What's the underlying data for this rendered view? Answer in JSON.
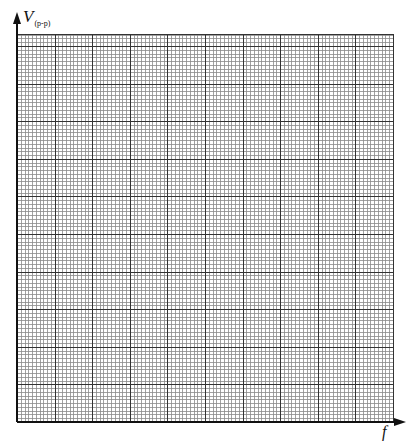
{
  "chart_data": {
    "type": "line",
    "title": "",
    "xlabel": "f",
    "ylabel": "V",
    "ylabel_subscript": "(p-p)",
    "series": [],
    "x": [],
    "values": [],
    "grid": true,
    "grid_style": {
      "major_divisions_x": 10,
      "minor_per_major": 10,
      "major_spacing_px": 37.6,
      "minor_color": "#8a8a8a",
      "major_color": "#333333",
      "axis_color": "#111111"
    },
    "axes_ticks_labeled": false,
    "legend": null,
    "note": "Blank graph paper template with unlabeled axes for plotting peak-to-peak voltage versus frequency"
  },
  "labels": {
    "y_axis_main": "V",
    "y_axis_sub": "(p-p)",
    "x_axis": "f"
  }
}
